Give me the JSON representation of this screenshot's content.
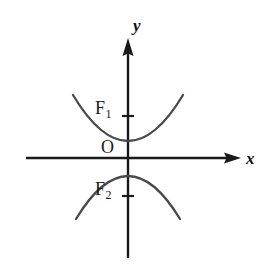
{
  "figure": {
    "type": "coordinate-plane-diagram",
    "background_color": "#ffffff",
    "stroke_color": "#1a1a1a",
    "curve_color": "#4a4a4a",
    "axes": {
      "x_axis": {
        "label": "x",
        "start_px": 26,
        "end_px": 240,
        "y_px": 158,
        "arrow": "right"
      },
      "y_axis": {
        "label": "y",
        "start_px": 258,
        "end_px": 38,
        "x_px": 128,
        "arrow": "up"
      },
      "origin": {
        "label": "O",
        "x_px": 128,
        "y_px": 158
      }
    },
    "ticks": [
      {
        "name": "tick-f1",
        "axis": "y",
        "y_px": 116,
        "half_width_px": 5
      },
      {
        "name": "tick-f2",
        "axis": "y",
        "y_px": 196,
        "half_width_px": 5
      }
    ],
    "points": [
      {
        "name": "F1",
        "label": "F",
        "subscript": "1",
        "x_px": 128,
        "y_px": 116
      },
      {
        "name": "F2",
        "label": "F",
        "subscript": "2",
        "x_px": 128,
        "y_px": 196
      }
    ],
    "curves": [
      {
        "name": "upper-parabola",
        "opens": "up",
        "vertex_px": {
          "x": 128,
          "y": 140
        },
        "left_end_px": {
          "x": 73,
          "y": 95
        },
        "right_end_px": {
          "x": 183,
          "y": 95
        }
      },
      {
        "name": "lower-parabola",
        "opens": "down",
        "vertex_px": {
          "x": 128,
          "y": 176
        },
        "left_end_px": {
          "x": 76,
          "y": 219
        },
        "right_end_px": {
          "x": 180,
          "y": 219
        }
      }
    ]
  },
  "labels": {
    "y_axis": "y",
    "x_axis": "x",
    "origin": "O",
    "f1_base": "F",
    "f1_sub": "1",
    "f2_base": "F",
    "f2_sub": "2"
  }
}
